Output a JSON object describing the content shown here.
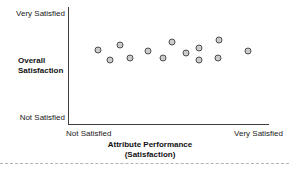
{
  "chart": {
    "y_axis": {
      "top_label": "Very Satisfied",
      "bottom_label": "Not Satisfied",
      "title_line1": "Overall",
      "title_line2": "Satisfaction"
    },
    "x_axis": {
      "left_label": "Not Satisfied",
      "right_label": "Very Satisfied",
      "title_line1": "Attribute Performance",
      "title_line2": "(Satisfaction)"
    },
    "colors": {
      "point_fill": "#cccccc",
      "point_stroke": "#4d4d4d",
      "axis_line": "#3d3d3d",
      "divider": "#b3b3b3",
      "background": "#ffffff"
    }
  },
  "chart_data": {
    "type": "scatter",
    "title": "",
    "xlabel": "Attribute Performance (Satisfaction)",
    "ylabel": "Overall Satisfaction",
    "x_axis_endpoint_labels": [
      "Not Satisfied",
      "Very Satisfied"
    ],
    "y_axis_endpoint_labels": [
      "Not Satisfied",
      "Very Satisfied"
    ],
    "axis_scale_note": "qualitative axes, values normalized 0 = Not Satisfied, 1 = Very Satisfied",
    "xlim": [
      0,
      1
    ],
    "ylim": [
      0,
      1
    ],
    "grid": false,
    "legend": false,
    "points": [
      {
        "x": 0.145,
        "y": 0.632
      },
      {
        "x": 0.205,
        "y": 0.547
      },
      {
        "x": 0.255,
        "y": 0.675
      },
      {
        "x": 0.305,
        "y": 0.564
      },
      {
        "x": 0.395,
        "y": 0.624
      },
      {
        "x": 0.47,
        "y": 0.568
      },
      {
        "x": 0.513,
        "y": 0.697
      },
      {
        "x": 0.585,
        "y": 0.603
      },
      {
        "x": 0.65,
        "y": 0.65
      },
      {
        "x": 0.65,
        "y": 0.547
      },
      {
        "x": 0.75,
        "y": 0.722
      },
      {
        "x": 0.745,
        "y": 0.564
      },
      {
        "x": 0.895,
        "y": 0.624
      }
    ]
  }
}
